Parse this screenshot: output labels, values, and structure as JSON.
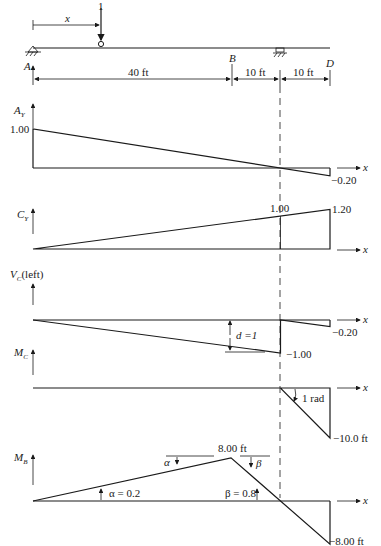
{
  "beam": {
    "load_label": "1",
    "distance_label": "x",
    "points": {
      "A": "A",
      "B": "B",
      "D": "D"
    },
    "spans": [
      {
        "label": "40 ft",
        "length_ft": 40
      },
      {
        "label": "10 ft",
        "length_ft": 10
      },
      {
        "label": "10 ft",
        "length_ft": 10
      }
    ]
  },
  "chart_data": [
    {
      "type": "line",
      "name": "influence-line-Ay",
      "ylabel_main": "A",
      "ylabel_sub": "Y",
      "xlabel": "x",
      "points": [
        [
          0,
          1.0
        ],
        [
          60,
          -0.2
        ]
      ],
      "labels": [
        "1.00",
        "−0.20"
      ]
    },
    {
      "type": "line",
      "name": "influence-line-Cy",
      "ylabel_main": "C",
      "ylabel_sub": "Y",
      "xlabel": "x",
      "points": [
        [
          0,
          0
        ],
        [
          50,
          1.0
        ],
        [
          60,
          1.2
        ]
      ],
      "labels": [
        "1.00",
        "1.20"
      ]
    },
    {
      "type": "line",
      "name": "influence-line-Vc-left",
      "ylabel_main": "V",
      "ylabel_sub": "C",
      "ylabel_suffix": "(left)",
      "xlabel": "x",
      "points": [
        [
          0,
          0
        ],
        [
          50,
          -1.0
        ],
        [
          50,
          0
        ],
        [
          60,
          -0.2
        ]
      ],
      "labels": [
        "−1.00",
        "−0.20"
      ],
      "annotation": "d =1"
    },
    {
      "type": "line",
      "name": "influence-line-Mc",
      "ylabel_main": "M",
      "ylabel_sub": "C",
      "xlabel": "x",
      "points": [
        [
          0,
          0
        ],
        [
          50,
          0
        ],
        [
          60,
          -10.0
        ]
      ],
      "labels": [
        "−10.0 ft"
      ],
      "annotation": "1 rad"
    },
    {
      "type": "line",
      "name": "influence-line-Mb",
      "ylabel_main": "M",
      "ylabel_sub": "B",
      "xlabel": "x",
      "points": [
        [
          0,
          0
        ],
        [
          40,
          8.0
        ],
        [
          60,
          -8.0
        ]
      ],
      "labels": [
        "8.00 ft",
        "−8.00 ft"
      ],
      "annotations": {
        "alpha": "α",
        "beta": "β",
        "alpha_value": "α = 0.2",
        "beta_value": "β = 0.8"
      }
    }
  ]
}
